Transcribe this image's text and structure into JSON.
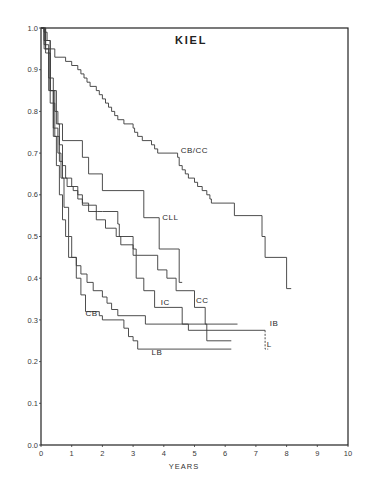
{
  "chart_data": {
    "type": "line",
    "subtype": "kaplan-meier step survival curves",
    "title": "KIEL",
    "xlabel": "YEARS",
    "ylabel": "",
    "xlim": [
      0,
      10
    ],
    "ylim": [
      0.0,
      1.0
    ],
    "x_ticks": [
      "0",
      "1",
      "2",
      "3",
      "4",
      "5",
      "6",
      "7",
      "8",
      "9",
      "10"
    ],
    "y_ticks": [
      "0.0",
      "0.1",
      "0.2",
      "0.3",
      "0.4",
      "0.5",
      "0.6",
      "0.7",
      "0.8",
      "0.9",
      "1.0"
    ],
    "grid": false,
    "legend": "inline labels at curve ends",
    "series": [
      {
        "name": "CB/CC",
        "label_pos": [
          4.55,
          0.7
        ],
        "points": [
          [
            0,
            1.0
          ],
          [
            0.1,
            0.99
          ],
          [
            0.2,
            0.97
          ],
          [
            0.3,
            0.95
          ],
          [
            0.45,
            0.93
          ],
          [
            0.8,
            0.92
          ],
          [
            1.0,
            0.91
          ],
          [
            1.2,
            0.9
          ],
          [
            1.3,
            0.89
          ],
          [
            1.4,
            0.88
          ],
          [
            1.5,
            0.87
          ],
          [
            1.6,
            0.86
          ],
          [
            1.8,
            0.85
          ],
          [
            1.9,
            0.84
          ],
          [
            2.0,
            0.83
          ],
          [
            2.1,
            0.82
          ],
          [
            2.2,
            0.81
          ],
          [
            2.3,
            0.8
          ],
          [
            2.4,
            0.79
          ],
          [
            2.5,
            0.78
          ],
          [
            2.7,
            0.77
          ],
          [
            3.0,
            0.76
          ],
          [
            3.05,
            0.75
          ],
          [
            3.15,
            0.74
          ],
          [
            3.3,
            0.73
          ],
          [
            3.6,
            0.72
          ],
          [
            3.7,
            0.71
          ],
          [
            3.8,
            0.7
          ],
          [
            4.45,
            0.69
          ],
          [
            4.5,
            0.67
          ],
          [
            4.6,
            0.66
          ],
          [
            4.7,
            0.65
          ],
          [
            4.8,
            0.64
          ],
          [
            5.0,
            0.63
          ],
          [
            5.1,
            0.62
          ],
          [
            5.25,
            0.61
          ],
          [
            5.4,
            0.6
          ],
          [
            5.5,
            0.59
          ],
          [
            5.55,
            0.58
          ],
          [
            6.3,
            0.55
          ],
          [
            7.2,
            0.5
          ],
          [
            7.3,
            0.45
          ],
          [
            8.0,
            0.375
          ],
          [
            8.15,
            0.375
          ]
        ]
      },
      {
        "name": "CLL",
        "label_pos": [
          3.95,
          0.54
        ],
        "points": [
          [
            0,
            1.0
          ],
          [
            0.1,
            0.97
          ],
          [
            0.3,
            0.85
          ],
          [
            0.45,
            0.8
          ],
          [
            0.55,
            0.77
          ],
          [
            0.7,
            0.73
          ],
          [
            1.35,
            0.69
          ],
          [
            1.55,
            0.65
          ],
          [
            2.0,
            0.61
          ],
          [
            3.35,
            0.545
          ],
          [
            3.85,
            0.47
          ],
          [
            4.5,
            0.39
          ],
          [
            4.6,
            0.39
          ]
        ]
      },
      {
        "name": "CC",
        "label_pos": [
          5.05,
          0.34
        ],
        "points": [
          [
            0,
            1.0
          ],
          [
            0.15,
            0.95
          ],
          [
            0.3,
            0.85
          ],
          [
            0.5,
            0.77
          ],
          [
            0.6,
            0.72
          ],
          [
            0.7,
            0.67
          ],
          [
            0.8,
            0.64
          ],
          [
            1.0,
            0.62
          ],
          [
            1.2,
            0.6
          ],
          [
            1.35,
            0.58
          ],
          [
            1.55,
            0.56
          ],
          [
            1.85,
            0.56
          ],
          [
            2.0,
            0.56
          ],
          [
            2.5,
            0.53
          ],
          [
            2.55,
            0.5
          ],
          [
            3.0,
            0.47
          ],
          [
            3.1,
            0.455
          ],
          [
            3.8,
            0.42
          ],
          [
            4.1,
            0.4
          ],
          [
            4.4,
            0.37
          ],
          [
            5.0,
            0.33
          ],
          [
            5.35,
            0.29
          ],
          [
            5.4,
            0.25
          ],
          [
            6.2,
            0.25
          ]
        ]
      },
      {
        "name": "IC",
        "label_pos": [
          3.9,
          0.335
        ],
        "points": [
          [
            0,
            1.0
          ],
          [
            0.15,
            0.94
          ],
          [
            0.3,
            0.82
          ],
          [
            0.45,
            0.74
          ],
          [
            0.6,
            0.68
          ],
          [
            0.7,
            0.64
          ],
          [
            0.85,
            0.62
          ],
          [
            1.05,
            0.61
          ],
          [
            1.2,
            0.59
          ],
          [
            1.35,
            0.575
          ],
          [
            1.8,
            0.54
          ],
          [
            2.1,
            0.52
          ],
          [
            2.45,
            0.5
          ],
          [
            2.6,
            0.48
          ],
          [
            3.0,
            0.455
          ],
          [
            3.1,
            0.4
          ],
          [
            3.35,
            0.37
          ],
          [
            3.7,
            0.33
          ],
          [
            4.6,
            0.29
          ],
          [
            4.8,
            0.275
          ],
          [
            7.3,
            0.275
          ]
        ]
      },
      {
        "name": "IB",
        "label_pos": [
          7.45,
          0.285
        ],
        "points": [
          [
            0,
            1.0
          ],
          [
            0.1,
            0.96
          ],
          [
            0.25,
            0.88
          ],
          [
            0.4,
            0.76
          ],
          [
            0.55,
            0.7
          ],
          [
            0.65,
            0.64
          ],
          [
            0.75,
            0.57
          ],
          [
            0.9,
            0.5
          ],
          [
            1.0,
            0.45
          ],
          [
            1.15,
            0.43
          ],
          [
            1.3,
            0.41
          ],
          [
            1.5,
            0.39
          ],
          [
            1.7,
            0.37
          ],
          [
            2.0,
            0.355
          ],
          [
            2.15,
            0.34
          ],
          [
            2.3,
            0.325
          ],
          [
            2.5,
            0.31
          ],
          [
            3.4,
            0.29
          ],
          [
            6.4,
            0.29
          ]
        ]
      },
      {
        "name": "CB",
        "label_pos": [
          1.45,
          0.31
        ],
        "points": [
          [
            0,
            1.0
          ],
          [
            0.1,
            0.95
          ],
          [
            0.25,
            0.85
          ],
          [
            0.4,
            0.74
          ],
          [
            0.5,
            0.67
          ],
          [
            0.6,
            0.6
          ],
          [
            0.7,
            0.54
          ],
          [
            0.8,
            0.5
          ],
          [
            0.9,
            0.45
          ],
          [
            1.1,
            0.45
          ],
          [
            1.15,
            0.4
          ],
          [
            1.3,
            0.36
          ],
          [
            1.45,
            0.32
          ],
          [
            1.9,
            0.31
          ],
          [
            2.0,
            0.3
          ],
          [
            2.7,
            0.28
          ],
          [
            2.85,
            0.26
          ],
          [
            3.0,
            0.25
          ],
          [
            3.15,
            0.23
          ],
          [
            6.2,
            0.23
          ]
        ]
      },
      {
        "name": "LB",
        "label_pos": [
          3.6,
          0.215
        ],
        "points": []
      },
      {
        "name": "L",
        "label_pos": [
          7.35,
          0.235
        ],
        "points": [
          [
            7.3,
            0.275
          ],
          [
            7.3,
            0.23
          ],
          [
            7.4,
            0.23
          ]
        ],
        "style": "dashed"
      }
    ]
  },
  "labels": {
    "title": "KIEL",
    "xlabel": "YEARS"
  }
}
